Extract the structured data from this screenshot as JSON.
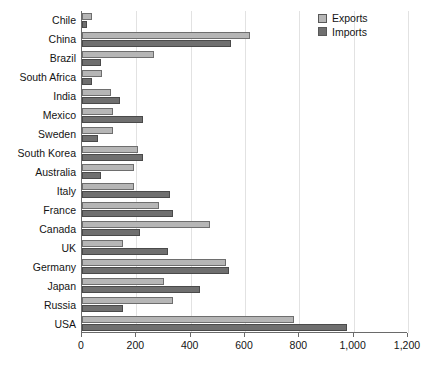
{
  "chart_data": {
    "type": "bar",
    "orientation": "horizontal",
    "title": "",
    "subtitle": "",
    "xlabel": "",
    "ylabel": "",
    "xlim": [
      0,
      1200
    ],
    "xticks": [
      0,
      200,
      400,
      600,
      800,
      1000,
      1200
    ],
    "xtick_labels": [
      "0",
      "200",
      "400",
      "600",
      "800",
      "1,000",
      "1,200"
    ],
    "grid": true,
    "grid_axis": "x",
    "legend": {
      "position": "top-right",
      "entries": [
        {
          "name": "Exports",
          "color": "#b6b6b6"
        },
        {
          "name": "Imports",
          "color": "#6f6f6f"
        }
      ]
    },
    "categories": [
      "Chile",
      "China",
      "Brazil",
      "South Africa",
      "India",
      "Mexico",
      "Sweden",
      "South Korea",
      "Australia",
      "Italy",
      "France",
      "Canada",
      "UK",
      "Germany",
      "Japan",
      "Russia",
      "USA"
    ],
    "series": [
      {
        "name": "Exports",
        "color": "#b6b6b6",
        "values": [
          35,
          620,
          265,
          75,
          105,
          115,
          115,
          205,
          190,
          190,
          285,
          470,
          150,
          530,
          300,
          335,
          780
        ]
      },
      {
        "name": "Imports",
        "color": "#6f6f6f",
        "values": [
          20,
          550,
          70,
          35,
          140,
          225,
          60,
          225,
          70,
          325,
          335,
          215,
          315,
          540,
          435,
          150,
          975
        ]
      }
    ]
  }
}
